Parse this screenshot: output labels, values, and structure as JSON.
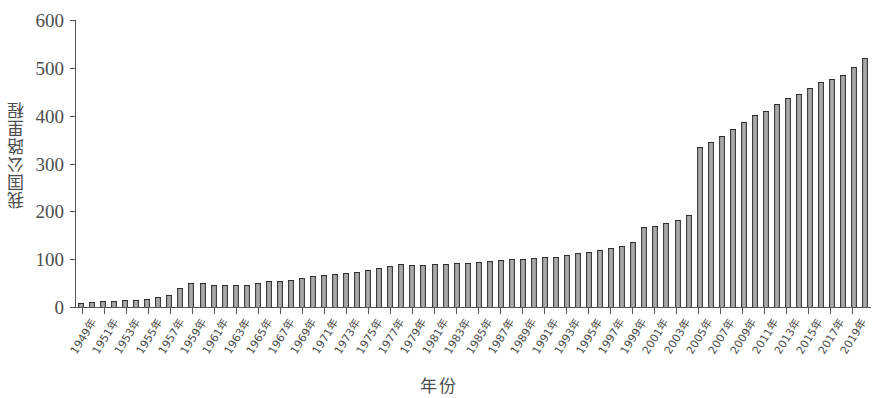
{
  "chart_data": {
    "type": "bar",
    "title": "",
    "xlabel": "年份",
    "ylabel": "我国公路里程",
    "ylim": [
      0,
      600
    ],
    "yticks": [
      0,
      100,
      200,
      300,
      400,
      500,
      600
    ],
    "grid": false,
    "legend": null,
    "bar_color": "#8e8e8e",
    "bar_edge_color": "#2e2e2e",
    "axis_color": "#555555",
    "text_color": "#4d4d4d",
    "background": "#ffffff",
    "xtick_label_suffix": "年",
    "xtick_label_rotation": -58,
    "xtick_label_interval_years": 2,
    "categories": [
      "1949年",
      "1950年",
      "1951年",
      "1952年",
      "1953年",
      "1954年",
      "1955年",
      "1956年",
      "1957年",
      "1958年",
      "1959年",
      "1960年",
      "1961年",
      "1962年",
      "1963年",
      "1964年",
      "1965年",
      "1966年",
      "1967年",
      "1968年",
      "1969年",
      "1970年",
      "1971年",
      "1972年",
      "1973年",
      "1974年",
      "1975年",
      "1976年",
      "1977年",
      "1978年",
      "1979年",
      "1980年",
      "1981年",
      "1982年",
      "1983年",
      "1984年",
      "1985年",
      "1986年",
      "1987年",
      "1988年",
      "1989年",
      "1990年",
      "1991年",
      "1992年",
      "1993年",
      "1994年",
      "1995年",
      "1996年",
      "1997年",
      "1998年",
      "1999年",
      "2000年",
      "2001年",
      "2002年",
      "2003年",
      "2004年",
      "2005年",
      "2006年",
      "2007年",
      "2008年",
      "2009年",
      "2010年",
      "2011年",
      "2012年",
      "2013年",
      "2014年",
      "2015年",
      "2016年",
      "2017年",
      "2018年",
      "2019年",
      "2020年"
    ],
    "xtick_labels_shown": [
      "1949年",
      "1951年",
      "1953年",
      "1955年",
      "1957年",
      "1959年",
      "1961年",
      "1963年",
      "1965年",
      "1967年",
      "1969年",
      "1971年",
      "1973年",
      "1975年",
      "1977年",
      "1979年",
      "1981年",
      "1983年",
      "1985年",
      "1987年",
      "1989年",
      "1991年",
      "1993年",
      "1995年",
      "1997年",
      "1999年",
      "2001年",
      "2003年",
      "2005年",
      "2007年",
      "2009年",
      "2011年",
      "2013年",
      "2015年",
      "2017年",
      "2019年"
    ],
    "values": [
      8,
      10,
      12,
      13,
      14,
      15,
      17,
      21,
      25,
      40,
      50,
      51,
      47,
      46,
      46,
      47,
      51,
      54,
      55,
      57,
      60,
      64,
      67,
      69,
      72,
      74,
      78,
      82,
      85,
      89,
      88,
      88,
      89,
      90,
      91,
      92,
      94,
      96,
      98,
      100,
      101,
      102,
      104,
      105,
      108,
      112,
      115,
      119,
      123,
      128,
      135,
      168,
      170,
      176,
      181,
      193,
      335,
      346,
      358,
      373,
      386,
      401,
      410,
      424,
      436,
      446,
      458,
      470,
      477,
      485,
      501,
      520
    ]
  }
}
